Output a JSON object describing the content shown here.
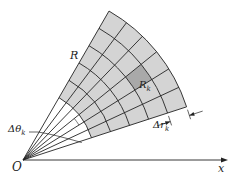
{
  "diagram": {
    "origin": {
      "x": 23,
      "y": 160
    },
    "angles_deg": [
      18,
      25,
      32,
      39,
      46,
      53,
      60
    ],
    "radii": [
      72,
      92,
      112,
      132,
      152,
      172
    ],
    "highlight_cell": {
      "ring": 3,
      "sector": 2
    },
    "colors": {
      "fill": "#d4d4d4",
      "highlight": "#a9a9a9",
      "stroke": "#222222",
      "background": "#ffffff"
    },
    "x_axis_end": 224
  },
  "labels": {
    "origin": "O",
    "x_axis": "x",
    "region": "R",
    "cell": "R",
    "cell_sub": "k",
    "delta_theta": "Δθ",
    "delta_theta_sub": "k",
    "delta_r": "Δr",
    "delta_r_sub": "k"
  }
}
